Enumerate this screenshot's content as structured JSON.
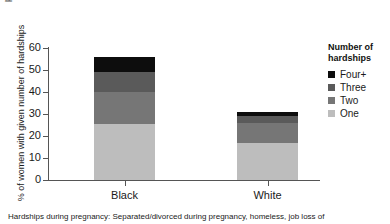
{
  "chart_data": {
    "type": "bar",
    "subtype": "stacked-bar",
    "title": "",
    "xlabel": "",
    "ylabel": "% of women with given number of hardships",
    "ylim": [
      0,
      60
    ],
    "yticks": [
      0,
      10,
      20,
      30,
      40,
      50,
      60
    ],
    "ytick_labels": [
      "0",
      "10",
      "20",
      "30",
      "40",
      "50",
      "60"
    ],
    "categories": [
      "Black",
      "White"
    ],
    "grid": false,
    "legend_position": "right",
    "legend_title": "Number of hardships",
    "series": [
      {
        "name": "One",
        "color": "#bdbdbd",
        "values": [
          25.5,
          17.0
        ]
      },
      {
        "name": "Two",
        "color": "#767676",
        "values": [
          14.5,
          9.0
        ]
      },
      {
        "name": "Three",
        "color": "#5a5a5a",
        "values": [
          9.0,
          3.0
        ]
      },
      {
        "name": "Four+",
        "color": "#0d0d0d",
        "values": [
          7.0,
          2.0
        ]
      }
    ],
    "totals": [
      56.0,
      31.0
    ],
    "annotations": []
  },
  "axis": {
    "y_title": "% of women with given number of hardships",
    "tick_labels": [
      "60",
      "50",
      "40",
      "30",
      "20",
      "10",
      "0"
    ],
    "x_labels": [
      "Black",
      "White"
    ]
  },
  "legend": {
    "title_line1": "Number of",
    "title_line2": "hardships",
    "items": [
      {
        "label": "Four+",
        "color": "#0d0d0d"
      },
      {
        "label": "Three",
        "color": "#5a5a5a"
      },
      {
        "label": "Two",
        "color": "#767676"
      },
      {
        "label": "One",
        "color": "#bdbdbd"
      }
    ]
  },
  "caption": {
    "text": "Hardships during pregnancy: Separated/divorced during pregnancy, homeless, job loss of"
  },
  "clipped": {
    "top_fragment": "ps"
  },
  "colors": {
    "axis": "#555555",
    "text": "#1a1a1a",
    "background": "#ffffff"
  }
}
